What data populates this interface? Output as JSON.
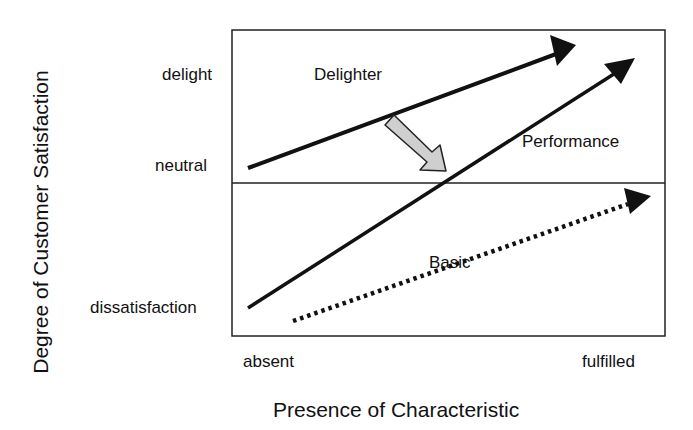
{
  "diagram": {
    "y_axis": {
      "title": "Degree of Customer Satisfaction",
      "ticks": [
        "delight",
        "neutral",
        "dissatisfaction"
      ]
    },
    "x_axis": {
      "title": "Presence of Characteristic",
      "ticks": [
        "absent",
        "fulfilled"
      ]
    },
    "curves": [
      {
        "name": "Delighter",
        "style": "solid",
        "from": [
          248,
          168
        ],
        "to": [
          575,
          47
        ]
      },
      {
        "name": "Performance",
        "style": "solid",
        "from": [
          248,
          308
        ],
        "to": [
          633,
          62
        ]
      },
      {
        "name": "Basic",
        "style": "dotted",
        "from": [
          293,
          321
        ],
        "to": [
          650,
          195
        ]
      }
    ],
    "shift_arrow": {
      "description": "Delighter shifts toward Performance over time",
      "fill": "#cfcfcf"
    },
    "colors": {
      "line": "#111111",
      "background": "#ffffff",
      "shift_arrow": "#cfcfcf"
    }
  }
}
